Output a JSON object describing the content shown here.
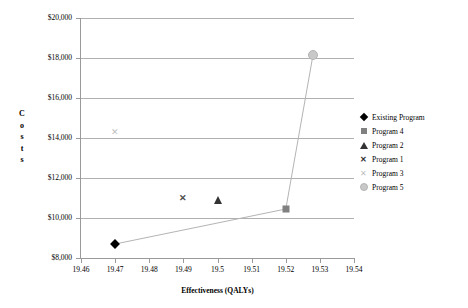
{
  "chart_data": {
    "type": "scatter",
    "title": "",
    "xlabel": "Effectiveness (QALYs)",
    "ylabel": "Costs",
    "xlim": [
      19.46,
      19.54
    ],
    "ylim": [
      8000,
      20000
    ],
    "xticks": [
      "19.46",
      "19.47",
      "19.48",
      "19.49",
      "19.5",
      "19.51",
      "19.52",
      "19.53",
      "19.54"
    ],
    "xtick_values": [
      19.46,
      19.47,
      19.48,
      19.49,
      19.5,
      19.51,
      19.52,
      19.53,
      19.54
    ],
    "yticks": [
      "$8,000",
      "$10,000",
      "$12,000",
      "$14,000",
      "$16,000",
      "$18,000",
      "$20,000"
    ],
    "ytick_values": [
      8000,
      10000,
      12000,
      14000,
      16000,
      18000,
      20000
    ],
    "grid": "horizontal",
    "legend_position": "right",
    "frontier_line": {
      "label": "efficiency-frontier",
      "color": "#b4b4b4",
      "points": [
        [
          19.47,
          8700
        ],
        [
          19.52,
          10450
        ],
        [
          19.528,
          18150
        ]
      ]
    },
    "series": [
      {
        "name": "Existing Program",
        "marker": "diamond",
        "color": "#000000",
        "x": 19.47,
        "y": 8700
      },
      {
        "name": "Program 4",
        "marker": "square",
        "color": "#808080",
        "x": 19.52,
        "y": 10450
      },
      {
        "name": "Program 2",
        "marker": "triangle",
        "color": "#333333",
        "x": 19.5,
        "y": 10900
      },
      {
        "name": "Program 1",
        "marker": "x-bold",
        "color": "#4d4d4d",
        "x": 19.49,
        "y": 11000
      },
      {
        "name": "Program 3",
        "marker": "x-light",
        "color": "#c0c0c0",
        "x": 19.47,
        "y": 14300
      },
      {
        "name": "Program 5",
        "marker": "circle",
        "color": "#c8c8c8",
        "x": 19.528,
        "y": 18150
      }
    ]
  },
  "axes": {
    "y_title_letters": [
      "C",
      "o",
      "s",
      "t",
      "s"
    ],
    "x_title": "Effectiveness (QALYs)"
  },
  "legend": {
    "items": [
      {
        "label": "Existing Program",
        "marker": "diamond"
      },
      {
        "label": "Program 4",
        "marker": "square"
      },
      {
        "label": "Program 2",
        "marker": "triangle"
      },
      {
        "label": "Program 1",
        "marker": "x-bold"
      },
      {
        "label": "Program 3",
        "marker": "x-light"
      },
      {
        "label": "Program 5",
        "marker": "circle"
      }
    ],
    "x_glyph": "✕"
  }
}
